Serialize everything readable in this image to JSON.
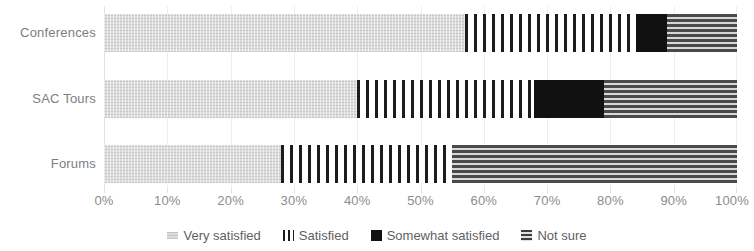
{
  "chart_data": {
    "type": "bar",
    "orientation": "horizontal",
    "stacked": true,
    "normalized_percent": true,
    "title": "",
    "subtitle": "",
    "xlabel": "",
    "ylabel": "",
    "xlim": [
      0,
      100
    ],
    "xtick_labels": [
      "0%",
      "10%",
      "20%",
      "30%",
      "40%",
      "50%",
      "60%",
      "70%",
      "80%",
      "90%",
      "100%"
    ],
    "xtick_values": [
      0,
      10,
      20,
      30,
      40,
      50,
      60,
      70,
      80,
      90,
      100
    ],
    "grid": "vertical",
    "legend_position": "bottom",
    "categories": [
      "Conferences",
      "SAC Tours",
      "Forums"
    ],
    "series": [
      {
        "name": "Very satisfied",
        "pattern": "light-gray-speckle",
        "color": "#dcdcdc",
        "values": [
          57,
          40,
          28
        ]
      },
      {
        "name": "Satisfied",
        "pattern": "vertical-stripes",
        "color": "#1c1c1c",
        "values": [
          27,
          28,
          27
        ]
      },
      {
        "name": "Somewhat satisfied",
        "pattern": "solid-black",
        "color": "#111111",
        "values": [
          5,
          11,
          0
        ]
      },
      {
        "name": "Not sure",
        "pattern": "horizontal-stripes",
        "color": "#4a4a4a",
        "values": [
          11,
          21,
          45
        ]
      }
    ]
  },
  "legend": {
    "items": [
      {
        "label": "Very satisfied",
        "icon": "legend-swatch-very-satisfied"
      },
      {
        "label": "Satisfied",
        "icon": "legend-swatch-satisfied"
      },
      {
        "label": "Somewhat satisfied",
        "icon": "legend-swatch-somewhat-satisfied"
      },
      {
        "label": "Not sure",
        "icon": "legend-swatch-not-sure"
      }
    ]
  }
}
